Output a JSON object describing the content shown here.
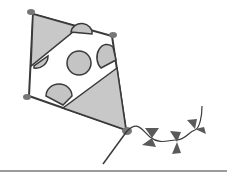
{
  "image": {
    "subject": "kite illustration",
    "colors": {
      "background": "#ffffff",
      "outline": "#3a3a3a",
      "shade": "#c4c4c4",
      "bow": "#5a5a5a",
      "ground": "#7a7a7a"
    }
  }
}
